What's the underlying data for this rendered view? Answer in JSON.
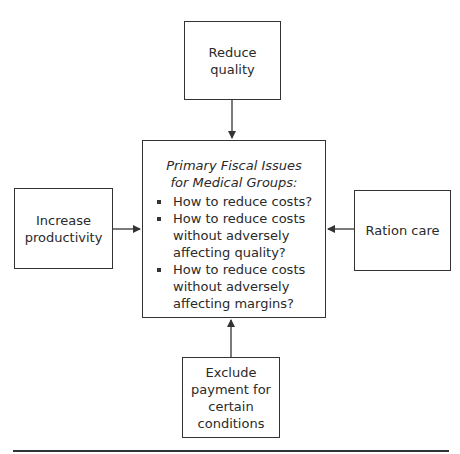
{
  "diagram": {
    "center": {
      "title_line1": "Primary Fiscal Issues",
      "title_line2": "for Medical Groups:",
      "bullets": [
        [
          "How to reduce costs?"
        ],
        [
          "How to reduce costs",
          "without adversely",
          "affecting quality?"
        ],
        [
          "How to reduce costs",
          "without adversely",
          "affecting margins?"
        ]
      ]
    },
    "top": {
      "lines": [
        "Reduce quality"
      ]
    },
    "left": {
      "lines": [
        "Increase",
        "productivity"
      ]
    },
    "right": {
      "lines": [
        "Ration care"
      ]
    },
    "bottom": {
      "lines": [
        "Exclude",
        "payment for",
        "certain",
        "conditions"
      ]
    }
  }
}
